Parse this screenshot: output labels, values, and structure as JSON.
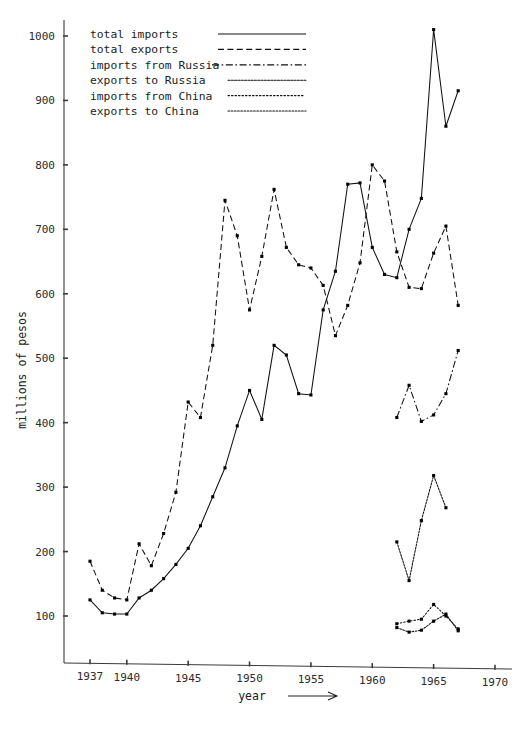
{
  "chart_data": {
    "type": "line",
    "title": "",
    "xlabel": "year",
    "xlabel_suffix": "⟶",
    "ylabel": "millions of pesos",
    "xlim": [
      1935.5,
      1970.5
    ],
    "ylim": [
      0,
      1030
    ],
    "xticks": [
      1937,
      1940,
      1945,
      1950,
      1955,
      1960,
      1965,
      1970
    ],
    "xticklabels": [
      "1937",
      "1940",
      "1945",
      "1950",
      "1955",
      "1960",
      "1965",
      "1970"
    ],
    "yticks": [
      100,
      200,
      300,
      400,
      500,
      600,
      700,
      800,
      900,
      1000
    ],
    "yticklabels": [
      "100",
      "200",
      "300",
      "400",
      "500",
      "600",
      "700",
      "800",
      "900",
      "1000"
    ],
    "grid": false,
    "legend_position": "top-left",
    "markers": "filled-square",
    "series": [
      {
        "name": "total imports",
        "style": "solid",
        "x": [
          1937,
          1938,
          1939,
          1940,
          1941,
          1942,
          1943,
          1944,
          1945,
          1946,
          1947,
          1948,
          1949,
          1950,
          1951,
          1952,
          1953,
          1954,
          1955,
          1956,
          1957,
          1958,
          1959,
          1960,
          1961,
          1962,
          1963,
          1964,
          1965,
          1966,
          1967
        ],
        "y": [
          125,
          105,
          103,
          103,
          128,
          140,
          158,
          180,
          205,
          240,
          285,
          330,
          395,
          450,
          405,
          520,
          505,
          445,
          443,
          575,
          635,
          770,
          772,
          672,
          630,
          625,
          700,
          748,
          1010,
          860,
          915
        ]
      },
      {
        "name": "total exports",
        "style": "dashed",
        "x": [
          1937,
          1938,
          1939,
          1940,
          1941,
          1942,
          1943,
          1944,
          1945,
          1946,
          1947,
          1948,
          1949,
          1950,
          1951,
          1952,
          1953,
          1954,
          1955,
          1956,
          1957,
          1958,
          1959,
          1960,
          1961,
          1962,
          1963,
          1964,
          1965,
          1966,
          1967
        ],
        "y": [
          185,
          140,
          128,
          125,
          212,
          178,
          228,
          292,
          432,
          408,
          520,
          745,
          690,
          575,
          658,
          762,
          672,
          645,
          640,
          613,
          535,
          582,
          648,
          800,
          775,
          665,
          610,
          608,
          663,
          705,
          582
        ]
      },
      {
        "name": "imports from Russia",
        "style": "dashdot",
        "x": [
          1962,
          1963,
          1964,
          1965,
          1966,
          1967
        ],
        "y": [
          408,
          458,
          402,
          412,
          445,
          512
        ]
      },
      {
        "name": "exports to Russia",
        "style": "wavy",
        "x": [
          1962,
          1963,
          1964,
          1965,
          1966
        ],
        "y": [
          215,
          155,
          248,
          318,
          268
        ]
      },
      {
        "name": "imports from China",
        "style": "dotted",
        "x": [
          1962,
          1963,
          1964,
          1965,
          1966,
          1967
        ],
        "y": [
          88,
          92,
          95,
          118,
          100,
          80
        ]
      },
      {
        "name": "exports to China",
        "style": "wavy-fine",
        "x": [
          1962,
          1963,
          1964,
          1965,
          1966,
          1967
        ],
        "y": [
          82,
          75,
          78,
          92,
          103,
          77
        ]
      }
    ]
  },
  "legend": {
    "items": [
      {
        "label": "total imports",
        "style": "solid"
      },
      {
        "label": "total exports",
        "style": "dashed"
      },
      {
        "label": "imports from Russia",
        "style": "dashdot"
      },
      {
        "label": "exports to Russia",
        "style": "wavy"
      },
      {
        "label": "imports from China",
        "style": "dotted"
      },
      {
        "label": "exports to China",
        "style": "wavy-fine"
      }
    ]
  }
}
